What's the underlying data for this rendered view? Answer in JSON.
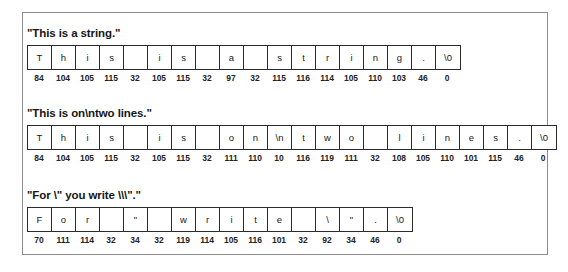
{
  "figure": {
    "caption_blocks": [
      {
        "title": "\"This is a string.\"",
        "cells": [
          {
            "ch": "T",
            "code": "84"
          },
          {
            "ch": "h",
            "code": "104"
          },
          {
            "ch": "i",
            "code": "105"
          },
          {
            "ch": "s",
            "code": "115"
          },
          {
            "ch": " ",
            "code": "32"
          },
          {
            "ch": "i",
            "code": "105"
          },
          {
            "ch": "s",
            "code": "115"
          },
          {
            "ch": " ",
            "code": "32"
          },
          {
            "ch": "a",
            "code": "97"
          },
          {
            "ch": " ",
            "code": "32"
          },
          {
            "ch": "s",
            "code": "115"
          },
          {
            "ch": "t",
            "code": "116"
          },
          {
            "ch": "r",
            "code": "114"
          },
          {
            "ch": "i",
            "code": "105"
          },
          {
            "ch": "n",
            "code": "110"
          },
          {
            "ch": "g",
            "code": "103"
          },
          {
            "ch": ".",
            "code": "46"
          },
          {
            "ch": "\\0",
            "code": "0"
          }
        ]
      },
      {
        "title": "\"This is on\\ntwo lines.\"",
        "cells": [
          {
            "ch": "T",
            "code": "84"
          },
          {
            "ch": "h",
            "code": "104"
          },
          {
            "ch": "i",
            "code": "105"
          },
          {
            "ch": "s",
            "code": "115"
          },
          {
            "ch": " ",
            "code": "32"
          },
          {
            "ch": "i",
            "code": "105"
          },
          {
            "ch": "s",
            "code": "115"
          },
          {
            "ch": " ",
            "code": "32"
          },
          {
            "ch": "o",
            "code": "111"
          },
          {
            "ch": "n",
            "code": "110"
          },
          {
            "ch": "\\n",
            "code": "10"
          },
          {
            "ch": "t",
            "code": "116"
          },
          {
            "ch": "w",
            "code": "119"
          },
          {
            "ch": "o",
            "code": "111"
          },
          {
            "ch": " ",
            "code": "32"
          },
          {
            "ch": "l",
            "code": "108"
          },
          {
            "ch": "i",
            "code": "105"
          },
          {
            "ch": "n",
            "code": "110"
          },
          {
            "ch": "e",
            "code": "101"
          },
          {
            "ch": "s",
            "code": "115"
          },
          {
            "ch": ".",
            "code": "46"
          },
          {
            "ch": "\\0",
            "code": "0"
          }
        ]
      },
      {
        "title": "\"For \\\" you write \\\\\\\".\"",
        "cells": [
          {
            "ch": "F",
            "code": "70"
          },
          {
            "ch": "o",
            "code": "111"
          },
          {
            "ch": "r",
            "code": "114"
          },
          {
            "ch": " ",
            "code": "32"
          },
          {
            "ch": "\"",
            "code": "34"
          },
          {
            "ch": " ",
            "code": "32"
          },
          {
            "ch": "w",
            "code": "119"
          },
          {
            "ch": "r",
            "code": "114"
          },
          {
            "ch": "i",
            "code": "105"
          },
          {
            "ch": "t",
            "code": "116"
          },
          {
            "ch": "e",
            "code": "101"
          },
          {
            "ch": " ",
            "code": "32"
          },
          {
            "ch": "\\",
            "code": "92"
          },
          {
            "ch": "\"",
            "code": "34"
          },
          {
            "ch": ".",
            "code": "46"
          },
          {
            "ch": "\\0",
            "code": "0"
          }
        ]
      }
    ]
  }
}
